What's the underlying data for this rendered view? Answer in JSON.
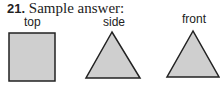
{
  "problem": {
    "number": "21.",
    "title": "Sample answer:"
  },
  "views": [
    {
      "label": "top",
      "shape": "square"
    },
    {
      "label": "side",
      "shape": "triangle"
    },
    {
      "label": "front",
      "shape": "triangle"
    }
  ],
  "colors": {
    "fill": "#cfcfcf",
    "stroke": "#222222"
  }
}
